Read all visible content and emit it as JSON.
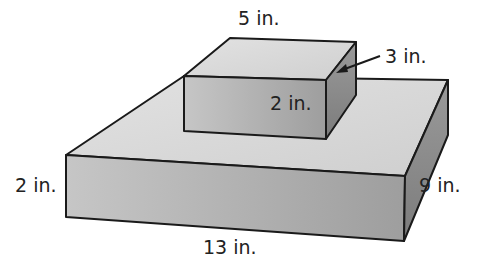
{
  "diagram": {
    "type": "stacked-rectangular-prisms",
    "top_box": {
      "length_label": "5 in.",
      "width_label": "3 in.",
      "height_label": "2 in."
    },
    "bottom_box": {
      "length_label": "13 in.",
      "width_label": "9 in.",
      "height_label": "2 in."
    },
    "colors": {
      "top_face": "#d9d9d9",
      "front_face": "#b3b3b3",
      "side_face": "#8c8c8c",
      "outline": "#1a1a1a"
    }
  }
}
